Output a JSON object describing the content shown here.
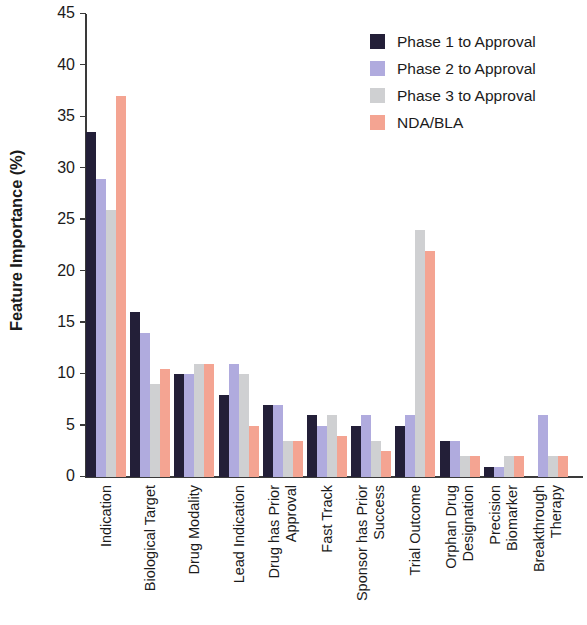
{
  "chart_data": {
    "type": "bar",
    "title": "",
    "subtitle": "",
    "xlabel": "",
    "ylabel": "Feature Importance (%)",
    "ylim": [
      0,
      45
    ],
    "ytick_step": 5,
    "yticks": [
      "45",
      "40",
      "35",
      "30",
      "25",
      "20",
      "15",
      "10",
      "5",
      "0"
    ],
    "grid": false,
    "legend_position": "top-right",
    "orientation": "vertical",
    "grouping": "grouped",
    "categories": [
      "Indication",
      "Biological Target",
      "Drug Modality",
      "Lead Indication",
      "Drug has Prior\nApproval",
      "Fast Track",
      "Sponsor has Prior\nSuccess",
      "Trial Outcome",
      "Orphan Drug\nDesignation",
      "Precision\nBiomarker",
      "Breakthrough\nTherapy"
    ],
    "series": [
      {
        "name": "Phase 1 to Approval",
        "color": "#231f38",
        "values": [
          33.5,
          16,
          10,
          8,
          7,
          6,
          5,
          5,
          3.5,
          1,
          0
        ]
      },
      {
        "name": "Phase 2 to Approval",
        "color": "#b0abde",
        "values": [
          29,
          14,
          10,
          11,
          7,
          5,
          6,
          6,
          3.5,
          1,
          6
        ]
      },
      {
        "name": "Phase 3 to Approval",
        "color": "#cfd0d2",
        "values": [
          26,
          9,
          11,
          10,
          3.5,
          6,
          3.5,
          24,
          2,
          2,
          2
        ]
      },
      {
        "name": "NDA/BLA",
        "color": "#f4a492",
        "values": [
          37,
          10.5,
          11,
          5,
          3.5,
          4,
          2.5,
          22,
          2,
          2,
          2
        ]
      }
    ]
  },
  "axis": {
    "line_color": "#3a3a3a",
    "text_color": "#1b1b1b"
  }
}
